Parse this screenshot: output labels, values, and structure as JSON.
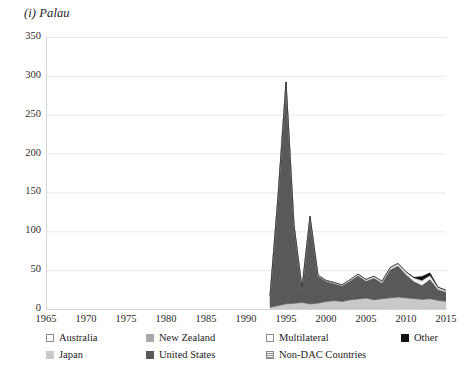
{
  "chart_data": {
    "type": "area",
    "title": "(i) Palau",
    "xlabel": "",
    "ylabel": "",
    "xlim": [
      1965,
      2015
    ],
    "ylim": [
      0,
      350
    ],
    "ytick_labels": [
      "0",
      "50",
      "100",
      "150",
      "200",
      "250",
      "300",
      "350"
    ],
    "ytick_values": [
      0,
      50,
      100,
      150,
      200,
      250,
      300,
      350
    ],
    "xtick_labels": [
      "1965",
      "1970",
      "1975",
      "1980",
      "1985",
      "1990",
      "1995",
      "2000",
      "2005",
      "2010",
      "2015"
    ],
    "xtick_values": [
      1965,
      1970,
      1975,
      1980,
      1985,
      1990,
      1995,
      2000,
      2005,
      2010,
      2015
    ],
    "grid": true,
    "stacked": true,
    "legend_position": "bottom",
    "x": [
      1993,
      1994,
      1995,
      1996,
      1997,
      1998,
      1999,
      2000,
      2001,
      2002,
      2003,
      2004,
      2005,
      2006,
      2007,
      2008,
      2009,
      2010,
      2011,
      2012,
      2013,
      2014,
      2015
    ],
    "series": [
      {
        "name": "Australia",
        "color": "#fcfcfc",
        "values": [
          0.2,
          0.3,
          0.4,
          0.3,
          0.3,
          0.4,
          0.4,
          0.5,
          0.6,
          0.5,
          0.6,
          0.7,
          0.8,
          0.7,
          0.9,
          1.0,
          1.2,
          1.0,
          1.1,
          1.0,
          0.9,
          0.8,
          0.7
        ]
      },
      {
        "name": "Japan",
        "color": "#c9c9c9",
        "values": [
          2.0,
          4.0,
          6.0,
          7.0,
          8.0,
          6.0,
          7.0,
          9.0,
          10.0,
          9.0,
          11.0,
          12.0,
          13.0,
          11.0,
          12.0,
          13.0,
          14.0,
          13.0,
          12.0,
          11.0,
          12.0,
          10.0,
          9.0
        ]
      },
      {
        "name": "New Zealand",
        "color": "#a9a9a9",
        "values": [
          0.1,
          0.1,
          0.2,
          0.2,
          0.2,
          0.2,
          0.2,
          0.2,
          0.3,
          0.3,
          0.3,
          0.3,
          0.3,
          0.3,
          0.4,
          0.4,
          0.4,
          0.4,
          0.4,
          0.4,
          0.4,
          0.3,
          0.3
        ]
      },
      {
        "name": "United States",
        "color": "#595959",
        "values": [
          14.0,
          140.0,
          285.0,
          100.0,
          18.0,
          112.0,
          35.0,
          26.0,
          22.0,
          20.0,
          24.0,
          30.0,
          22.0,
          28.0,
          20.0,
          36.0,
          40.0,
          30.0,
          22.0,
          18.0,
          25.0,
          14.0,
          12.0
        ]
      },
      {
        "name": "Multilateral",
        "color": "#ffffff",
        "values": [
          0.3,
          0.4,
          0.5,
          0.5,
          0.6,
          0.5,
          0.6,
          0.8,
          1.0,
          0.9,
          1.2,
          1.5,
          1.4,
          1.6,
          1.8,
          2.0,
          2.2,
          2.5,
          3.5,
          5.0,
          4.0,
          2.0,
          1.5
        ]
      },
      {
        "name": "Non-DAC Countries",
        "color": "#e3e3e3",
        "values": [
          0.1,
          0.1,
          0.1,
          0.2,
          0.2,
          0.2,
          0.3,
          0.3,
          0.4,
          0.4,
          0.5,
          0.5,
          0.6,
          0.6,
          0.7,
          0.8,
          0.9,
          1.0,
          1.2,
          1.5,
          1.2,
          0.8,
          0.6
        ]
      },
      {
        "name": "Other",
        "color": "#111111",
        "values": [
          0.0,
          0.0,
          0.0,
          0.0,
          0.0,
          0.0,
          0.0,
          0.0,
          0.0,
          0.0,
          0.0,
          0.0,
          0.0,
          0.0,
          0.0,
          0.0,
          0.0,
          0.0,
          0.5,
          5.0,
          3.0,
          0.3,
          0.0
        ]
      }
    ],
    "legend_order": [
      "Australia",
      "New Zealand",
      "Multilateral",
      "Other",
      "Japan",
      "United States",
      "Non-DAC Countries"
    ]
  }
}
